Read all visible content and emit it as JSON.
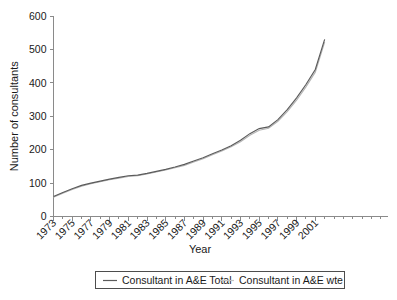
{
  "chart_data": {
    "type": "line",
    "title": "",
    "xlabel": "Year",
    "ylabel": "Number of consultants",
    "xlim": [
      1973,
      2002
    ],
    "ylim": [
      0,
      600
    ],
    "ytick_values": [
      0,
      100,
      200,
      300,
      400,
      500,
      600
    ],
    "ytick_labels": [
      "0",
      "100",
      "200",
      "300",
      "400",
      "500",
      "600"
    ],
    "xtick_labels": [
      "1973",
      "1975",
      "1977",
      "1979",
      "1981",
      "1983",
      "1985",
      "1987",
      "1989",
      "1991",
      "1993",
      "1995",
      "1997",
      "1999",
      "2001"
    ],
    "xtick_values": [
      1973,
      1975,
      1977,
      1979,
      1981,
      1983,
      1985,
      1987,
      1989,
      1991,
      1993,
      1995,
      1997,
      1999,
      2001
    ],
    "grid": false,
    "legend_position": "bottom",
    "x": [
      1973,
      1974,
      1975,
      1976,
      1977,
      1978,
      1979,
      1980,
      1981,
      1982,
      1983,
      1984,
      1985,
      1986,
      1987,
      1988,
      1989,
      1990,
      1991,
      1992,
      1993,
      1994,
      1995,
      1996,
      1997,
      1998,
      1999,
      2000,
      2001,
      2002
    ],
    "series": [
      {
        "name": "Consultant in A&E Total",
        "color": "#5b5b5b",
        "values": [
          60,
          72,
          83,
          93,
          100,
          106,
          112,
          117,
          122,
          124,
          129,
          135,
          141,
          148,
          156,
          166,
          176,
          188,
          199,
          212,
          228,
          248,
          263,
          268,
          290,
          320,
          355,
          395,
          440,
          530
        ]
      },
      {
        "name": "Consultant in A&E wte",
        "color": "#b4b4b4",
        "values": [
          58,
          70,
          81,
          91,
          98,
          104,
          110,
          115,
          120,
          122,
          127,
          133,
          139,
          146,
          153,
          163,
          173,
          185,
          196,
          209,
          224,
          243,
          258,
          264,
          285,
          314,
          348,
          388,
          432,
          522
        ]
      }
    ],
    "annotations": []
  },
  "legend": {
    "entries": [
      {
        "label": "Consultant in A&E Total",
        "swatch": "solid-line-dark-gray"
      },
      {
        "label": "Consultant in A&E wte",
        "swatch": "solid-line-light-gray"
      }
    ]
  },
  "colors": {
    "axis": "#8a8a8a",
    "text": "#1a1a1a",
    "series_total": "#5b5b5b",
    "series_wte": "#b4b4b4",
    "legend_border": "#4d4d4d",
    "background": "#ffffff"
  }
}
